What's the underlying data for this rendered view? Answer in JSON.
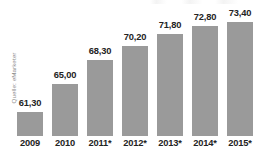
{
  "source": {
    "label": "Quelle: eMarketer"
  },
  "chart_data": {
    "type": "bar",
    "title": "",
    "subtitle": "",
    "xlabel": "",
    "ylabel": "",
    "grid": false,
    "legend": false,
    "legend_position": "none",
    "bar_color": "#9a9a9a",
    "label_color": "#232323",
    "background": "#ffffff",
    "decimal_separator": ",",
    "ylim": [
      0,
      80
    ],
    "categories": [
      "2009",
      "2010",
      "2011*",
      "2012*",
      "2013*",
      "2014*",
      "2015*"
    ],
    "values": [
      61.3,
      65.0,
      68.3,
      70.2,
      71.8,
      72.8,
      73.4
    ],
    "value_labels": [
      "61,30",
      "65,00",
      "68,30",
      "70,20",
      "71,80",
      "72,80",
      "73,40"
    ],
    "annotations": [
      "Quelle: eMarketer"
    ]
  },
  "bars": [
    {
      "category": "2009",
      "value_label": "61,30",
      "value": 61.3
    },
    {
      "category": "2010",
      "value_label": "65,00",
      "value": 65.0
    },
    {
      "category": "2011*",
      "value_label": "68,30",
      "value": 68.3
    },
    {
      "category": "2012*",
      "value_label": "70,20",
      "value": 70.2
    },
    {
      "category": "2013*",
      "value_label": "71,80",
      "value": 71.8
    },
    {
      "category": "2014*",
      "value_label": "72,80",
      "value": 72.8
    },
    {
      "category": "2015*",
      "value_label": "73,40",
      "value": 73.4
    }
  ]
}
